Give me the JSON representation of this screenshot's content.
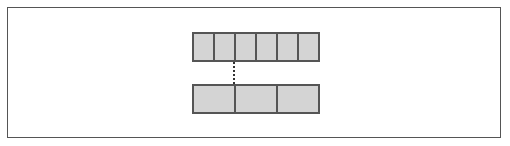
{
  "diagram": {
    "type": "array-split",
    "frame": {
      "x": 7,
      "y": 7,
      "width": 494,
      "height": 131
    },
    "colors": {
      "cell_fill": "#d4d4d4",
      "cell_border": "#555555",
      "frame_border": "#555555",
      "connector": "#333333",
      "background": "#ffffff"
    },
    "top_row": {
      "x": 192,
      "y": 32,
      "width": 128,
      "height": 30,
      "cell_count": 6,
      "cells": [
        "",
        "",
        "",
        "",
        "",
        ""
      ]
    },
    "bottom_row": {
      "x": 192,
      "y": 84,
      "width": 128,
      "height": 30,
      "cell_count": 3,
      "cells": [
        "",
        "",
        ""
      ]
    },
    "connector": {
      "style": "dotted",
      "x": 234,
      "y1": 62,
      "y2": 84,
      "from": "top_row.cell_2_left_edge",
      "to": "bottom_row.cell_1_right_edge"
    }
  }
}
